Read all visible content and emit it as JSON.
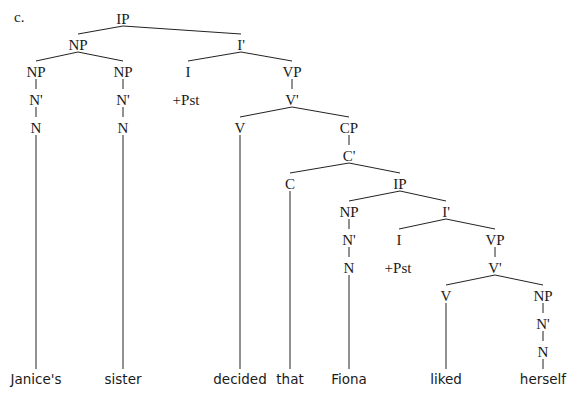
{
  "example_label": "c.",
  "nodes": [
    {
      "id": "ip1",
      "label": "IP",
      "x": 123,
      "y": 20
    },
    {
      "id": "np1",
      "label": "NP",
      "x": 78,
      "y": 46
    },
    {
      "id": "ibar1",
      "label": "I'",
      "x": 241,
      "y": 46
    },
    {
      "id": "np2",
      "label": "NP",
      "x": 36,
      "y": 73
    },
    {
      "id": "np3",
      "label": "NP",
      "x": 123,
      "y": 73
    },
    {
      "id": "i1",
      "label": "I",
      "x": 188,
      "y": 73
    },
    {
      "id": "vp1",
      "label": "VP",
      "x": 292,
      "y": 73
    },
    {
      "id": "nbar1",
      "label": "N'",
      "x": 36,
      "y": 101
    },
    {
      "id": "nbar2",
      "label": "N'",
      "x": 123,
      "y": 101
    },
    {
      "id": "pst1",
      "label": "+Pst",
      "x": 186,
      "y": 101
    },
    {
      "id": "vbar1",
      "label": "V'",
      "x": 292,
      "y": 101
    },
    {
      "id": "n1",
      "label": "N",
      "x": 36,
      "y": 129
    },
    {
      "id": "n2",
      "label": "N",
      "x": 123,
      "y": 129
    },
    {
      "id": "v1",
      "label": "V",
      "x": 240,
      "y": 129
    },
    {
      "id": "cp1",
      "label": "CP",
      "x": 349,
      "y": 129
    },
    {
      "id": "cbar1",
      "label": "C'",
      "x": 349,
      "y": 157
    },
    {
      "id": "c1",
      "label": "C",
      "x": 290,
      "y": 185
    },
    {
      "id": "ip2",
      "label": "IP",
      "x": 400,
      "y": 185
    },
    {
      "id": "np4",
      "label": "NP",
      "x": 349,
      "y": 213
    },
    {
      "id": "ibar2",
      "label": "I'",
      "x": 446,
      "y": 213
    },
    {
      "id": "nbar3",
      "label": "N'",
      "x": 349,
      "y": 241
    },
    {
      "id": "i2",
      "label": "I",
      "x": 399,
      "y": 241
    },
    {
      "id": "vp2",
      "label": "VP",
      "x": 495,
      "y": 241
    },
    {
      "id": "n3",
      "label": "N",
      "x": 349,
      "y": 269
    },
    {
      "id": "pst2",
      "label": "+Pst",
      "x": 398,
      "y": 269
    },
    {
      "id": "vbar2",
      "label": "V'",
      "x": 495,
      "y": 269
    },
    {
      "id": "v2",
      "label": "V",
      "x": 446,
      "y": 297
    },
    {
      "id": "np5",
      "label": "NP",
      "x": 543,
      "y": 297
    },
    {
      "id": "nbar4",
      "label": "N'",
      "x": 543,
      "y": 325
    },
    {
      "id": "n4",
      "label": "N",
      "x": 543,
      "y": 353
    }
  ],
  "edges": [
    [
      "ip1",
      "np1"
    ],
    [
      "ip1",
      "ibar1"
    ],
    [
      "np1",
      "np2"
    ],
    [
      "np1",
      "np3"
    ],
    [
      "ibar1",
      "i1"
    ],
    [
      "ibar1",
      "vp1"
    ],
    [
      "np2",
      "nbar1"
    ],
    [
      "nbar1",
      "n1"
    ],
    [
      "np3",
      "nbar2"
    ],
    [
      "nbar2",
      "n2"
    ],
    [
      "vp1",
      "vbar1"
    ],
    [
      "vbar1",
      "v1"
    ],
    [
      "vbar1",
      "cp1"
    ],
    [
      "cp1",
      "cbar1"
    ],
    [
      "cbar1",
      "c1"
    ],
    [
      "cbar1",
      "ip2"
    ],
    [
      "ip2",
      "np4"
    ],
    [
      "ip2",
      "ibar2"
    ],
    [
      "np4",
      "nbar3"
    ],
    [
      "nbar3",
      "n3"
    ],
    [
      "ibar2",
      "i2"
    ],
    [
      "ibar2",
      "vp2"
    ],
    [
      "vp2",
      "vbar2"
    ],
    [
      "vbar2",
      "v2"
    ],
    [
      "vbar2",
      "np5"
    ],
    [
      "np5",
      "nbar4"
    ],
    [
      "nbar4",
      "n4"
    ]
  ],
  "words": [
    {
      "text": "Janice's",
      "x": 36,
      "parent": "n1"
    },
    {
      "text": "sister",
      "x": 123,
      "parent": "n2"
    },
    {
      "text": "decided",
      "x": 240,
      "parent": "v1"
    },
    {
      "text": "that",
      "x": 290,
      "parent": "c1"
    },
    {
      "text": "Fiona",
      "x": 349,
      "parent": "n3"
    },
    {
      "text": "liked",
      "x": 446,
      "parent": "v2"
    },
    {
      "text": "herself",
      "x": 543,
      "parent": "n4"
    }
  ],
  "word_baseline_y": 384
}
